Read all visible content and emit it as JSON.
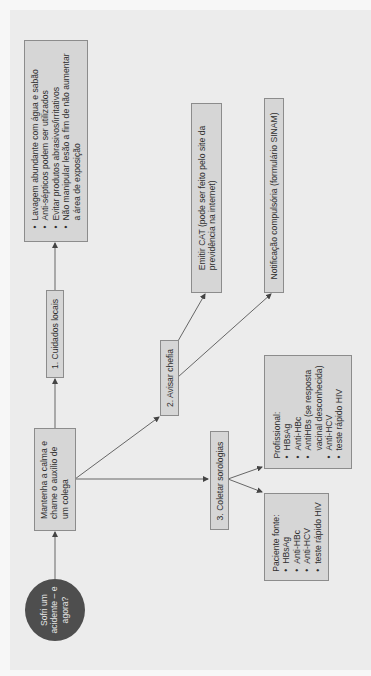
{
  "diagram": {
    "start": {
      "lines": [
        "Sofri um",
        "acidente – e",
        "agora?"
      ]
    },
    "calm": {
      "lines": [
        "Mantenha a calma e",
        "chame o auxílio de",
        "um colega"
      ]
    },
    "step1": {
      "label": "1. Cuidados locais"
    },
    "local_care": {
      "items": [
        "Lavagem abundante com água e sabão",
        "Anti-sépticos podem ser utilizados",
        "Evitar produtos abrasivos/irritativos",
        "Não manipular lesão a fim de não aumentar"
      ],
      "continuation": "a área de exposição"
    },
    "step2": {
      "label": "2. Avisar chefia"
    },
    "cat": {
      "lines": [
        "Emitir CAT (pode ser feito pelo site da",
        "previdência na internet)"
      ]
    },
    "notification": {
      "label": "Notificação compulsória (formulário SINAM)"
    },
    "step3": {
      "label": "3. Coletar sorologias"
    },
    "professional": {
      "title": "Profissional:",
      "items": [
        "HBsAg",
        "Anti-HBc",
        "AntiHBs (se resposta",
        "Anti-HCV",
        "teste rápido HIV"
      ],
      "continuation": "vacinal desconhecida)"
    },
    "source_patient": {
      "title": "Paciente fonte:",
      "items": [
        "HBsAg",
        "Anti-HBc",
        "Anti-HCV",
        "teste rápido HIV"
      ]
    },
    "colors": {
      "background": "#ececec",
      "box_fill": "#d6d6d6",
      "box_border": "#8c8c8c",
      "circle_fill": "#4e4e4e",
      "connector": "#555555"
    }
  }
}
